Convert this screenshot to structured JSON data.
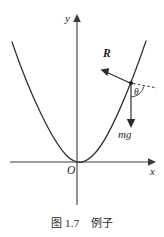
{
  "figure": {
    "background_color": "#ffffff",
    "ink_color": "#2b2b2b",
    "caption": "图 1.7　例子",
    "axes": {
      "y_label": "y",
      "x_label": "x",
      "origin_label": "O",
      "x_axis": {
        "x_start": 10,
        "x_end": 152,
        "y": 162
      },
      "y_axis": {
        "x": 77,
        "y_start": 14,
        "y_end": 205
      }
    },
    "curve": {
      "type": "parabola",
      "description": "upward-opening parabola tangent to x-axis",
      "vertex": {
        "x": 80,
        "y": 162
      },
      "left_end": {
        "x": 12,
        "y": 42
      },
      "right_end": {
        "x": 146,
        "y": 41
      }
    },
    "contact_point": {
      "x": 131,
      "y": 83
    },
    "vectors": [
      {
        "label": "R",
        "style": "bold-italic",
        "meaning": "normal-reaction-force",
        "from": {
          "x": 131,
          "y": 83
        },
        "to": {
          "x": 102,
          "y": 70
        },
        "label_pos": {
          "x": 103,
          "y": 50
        }
      },
      {
        "label": "mg",
        "style": "italic",
        "meaning": "weight",
        "from": {
          "x": 131,
          "y": 83
        },
        "to": {
          "x": 131,
          "y": 127
        },
        "label_pos": {
          "x": 119,
          "y": 130
        }
      }
    ],
    "angle": {
      "label": "θ",
      "label_pos": {
        "x": 135,
        "y": 92
      },
      "between": [
        "mg-vector",
        "dashed-reference-line"
      ]
    },
    "dashed_line": {
      "from": {
        "x": 131,
        "y": 83
      },
      "to": {
        "x": 156,
        "y": 88
      }
    }
  }
}
